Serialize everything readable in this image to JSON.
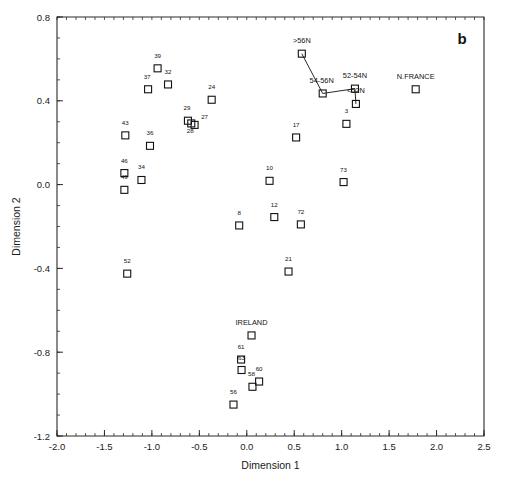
{
  "chart": {
    "panel_label": "b",
    "xlabel": "Dimension 1",
    "ylabel": "Dimension 2"
  },
  "chart_data": {
    "type": "scatter",
    "title": "",
    "panel_label": "b",
    "xlabel": "Dimension 1",
    "ylabel": "Dimension 2",
    "xlim": [
      -2.0,
      2.5
    ],
    "ylim": [
      -1.2,
      0.8
    ],
    "xticks": [
      -2.0,
      -1.5,
      -1.0,
      -0.5,
      0.0,
      0.5,
      1.0,
      1.5,
      2.0,
      2.5
    ],
    "xtick_labels": [
      "-2.0",
      "-1.5",
      "-1.0",
      "-0.5",
      "0.0",
      "0.5",
      "1.0",
      "1.5",
      "2.0",
      "2.5"
    ],
    "yticks": [
      -1.2,
      -0.8,
      -0.4,
      0.0,
      0.4,
      0.8
    ],
    "ytick_labels": [
      "-1.2",
      "-0.8",
      "-0.4",
      "0.0",
      "0.4",
      "0.8"
    ],
    "xtick_minor_step": 0.1,
    "ytick_minor_step": 0.1,
    "grid": false,
    "legend": false,
    "marker": "open-square",
    "points": [
      {
        "label": "39",
        "x": -0.94,
        "y": 0.555,
        "label_dx": 0,
        "label_dy": -7
      },
      {
        "label": "37",
        "x": -1.04,
        "y": 0.455,
        "label_dx": -1,
        "label_dy": -7
      },
      {
        "label": "32",
        "x": -0.83,
        "y": 0.478,
        "label_dx": 0,
        "label_dy": -7
      },
      {
        "label": "24",
        "x": -0.37,
        "y": 0.405,
        "label_dx": 0,
        "label_dy": -7
      },
      {
        "label": "29",
        "x": -0.62,
        "y": 0.305,
        "label_dx": -1,
        "label_dy": -7
      },
      {
        "label": "27",
        "x": -0.55,
        "y": 0.285,
        "label_dx": 10,
        "label_dy": -2
      },
      {
        "label": "28",
        "x": -0.585,
        "y": 0.292,
        "label_dx": -1,
        "label_dy": 13
      },
      {
        "label": "43",
        "x": -1.28,
        "y": 0.235,
        "label_dx": 0,
        "label_dy": -7
      },
      {
        "label": "36",
        "x": -1.02,
        "y": 0.185,
        "label_dx": 0,
        "label_dy": -7
      },
      {
        "label": "46",
        "x": -1.29,
        "y": 0.055,
        "label_dx": 0,
        "label_dy": -7
      },
      {
        "label": "34",
        "x": -1.11,
        "y": 0.022,
        "label_dx": 0,
        "label_dy": -7
      },
      {
        "label": "49",
        "x": -1.29,
        "y": -0.025,
        "label_dx": 0,
        "label_dy": -7
      },
      {
        "label": "52",
        "x": -1.26,
        "y": -0.425,
        "label_dx": 0,
        "label_dy": -7
      },
      {
        "label": "8",
        "x": -0.08,
        "y": -0.195,
        "label_dx": 0,
        "label_dy": -7
      },
      {
        "label": "12",
        "x": 0.29,
        "y": -0.155,
        "label_dx": 0,
        "label_dy": -7
      },
      {
        "label": "10",
        "x": 0.24,
        "y": 0.018,
        "label_dx": 0,
        "label_dy": -7
      },
      {
        "label": "17",
        "x": 0.52,
        "y": 0.225,
        "label_dx": 0,
        "label_dy": -7
      },
      {
        "label": "3",
        "x": 1.05,
        "y": 0.29,
        "label_dx": 0,
        "label_dy": -7
      },
      {
        "label": "73",
        "x": 1.02,
        "y": 0.012,
        "label_dx": 0,
        "label_dy": -7
      },
      {
        "label": "72",
        "x": 0.57,
        "y": -0.19,
        "label_dx": 0,
        "label_dy": -7
      },
      {
        "label": "21",
        "x": 0.44,
        "y": -0.415,
        "label_dx": 0,
        "label_dy": -7
      },
      {
        "label": "IRELAND",
        "x": 0.05,
        "y": -0.72,
        "label_dx": 0,
        "label_dy": -7,
        "named": true
      },
      {
        "label": "61",
        "x": -0.06,
        "y": -0.835,
        "label_dx": 0,
        "label_dy": -7
      },
      {
        "label": "63",
        "x": -0.055,
        "y": -0.885,
        "label_dx": 0,
        "label_dy": -7
      },
      {
        "label": "60",
        "x": 0.13,
        "y": -0.94,
        "label_dx": 0,
        "label_dy": -7
      },
      {
        "label": "58",
        "x": 0.06,
        "y": -0.965,
        "label_dx": -1,
        "label_dy": -7
      },
      {
        "label": "56",
        "x": -0.14,
        "y": -1.05,
        "label_dx": 0,
        "label_dy": -7
      },
      {
        "label": ">56N",
        "x": 0.58,
        "y": 0.625,
        "label_dx": 0,
        "label_dy": -7,
        "named": true
      },
      {
        "label": "54-56N",
        "x": 0.8,
        "y": 0.435,
        "label_dx": -1,
        "label_dy": -7,
        "named": true
      },
      {
        "label": "52-54N",
        "x": 1.14,
        "y": 0.458,
        "label_dx": 0,
        "label_dy": -7,
        "named": true
      },
      {
        "label": "<52N",
        "x": 1.15,
        "y": 0.385,
        "label_dx": 0,
        "label_dy": -7,
        "named": true
      },
      {
        "label": "N.FRANCE",
        "x": 1.78,
        "y": 0.455,
        "label_dx": 0,
        "label_dy": -7,
        "named": true
      }
    ],
    "connectors": [
      {
        "name": "latitude-series",
        "path": [
          ">56N",
          "54-56N",
          "52-54N",
          "<52N"
        ]
      }
    ]
  }
}
